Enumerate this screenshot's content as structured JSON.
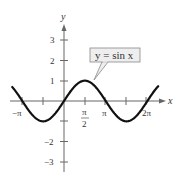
{
  "chart_data": {
    "type": "line",
    "title": "",
    "xlabel": "x",
    "ylabel": "y",
    "xlim": [
      -3.7,
      7.3
    ],
    "ylim": [
      -3.7,
      3.7
    ],
    "x_ticks": [
      {
        "value": -3.14159,
        "label": "−π"
      },
      {
        "value": -1.5708,
        "label": ""
      },
      {
        "value": 1.5708,
        "label": "π/2"
      },
      {
        "value": 3.14159,
        "label": "π"
      },
      {
        "value": 4.7124,
        "label": ""
      },
      {
        "value": 6.28319,
        "label": "2π"
      }
    ],
    "y_ticks": [
      {
        "value": 3,
        "label": "3"
      },
      {
        "value": 2,
        "label": "2"
      },
      {
        "value": 1,
        "label": "1"
      },
      {
        "value": -1,
        "label": ""
      },
      {
        "value": -2,
        "label": "−2"
      },
      {
        "value": -3,
        "label": "−3"
      }
    ],
    "series": [
      {
        "name": "y = sin x",
        "function": "sin(x)",
        "x_range": [
          -3.9,
          7.1
        ],
        "x": [
          -3.93,
          -3.14,
          -1.57,
          0,
          1.57,
          3.14,
          4.71,
          6.28,
          7.07
        ],
        "values": [
          0.71,
          0,
          -1,
          0,
          1,
          0,
          -1,
          0,
          0.71
        ]
      }
    ],
    "annotations": [
      {
        "text": "y = sin x",
        "type": "callout",
        "points_to": [
          2.0,
          0.91
        ]
      }
    ],
    "grid": false,
    "legend": "none",
    "colors": {
      "curve": "#111111",
      "axis": "#666666",
      "callout_fill": "#eeeeee",
      "callout_border": "#888888"
    }
  },
  "labels": {
    "x_axis": "x",
    "y_axis": "y",
    "callout": "y = sin x",
    "x_tick_neg_pi": "−π",
    "x_tick_pi_half_num": "π",
    "x_tick_pi_half_den": "2",
    "x_tick_pi": "π",
    "x_tick_2pi": "2π",
    "y_tick_3": "3",
    "y_tick_2": "2",
    "y_tick_1": "1",
    "y_tick_m2": "−2",
    "y_tick_m3": "−3"
  }
}
